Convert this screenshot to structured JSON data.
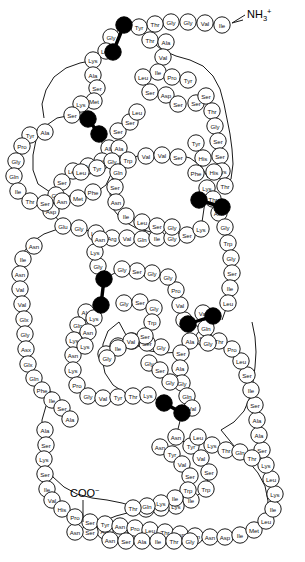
{
  "diagram": {
    "n_terminus_label": "NH",
    "n_terminus_sub": "3",
    "n_terminus_sup": "+",
    "c_terminus_label": "COO",
    "c_terminus_sup": "−",
    "residue_shape": "circle",
    "disulfide_shape": "filled-circle-pair",
    "colors": {
      "residue_fill": "#ffffff",
      "residue_stroke": "#1a1a1a",
      "cysteine_fill": "#000000",
      "background": "#ffffff",
      "text": "#111111"
    },
    "counts": {
      "disulfide_bonds": 6
    }
  },
  "residues": [
    {
      "n": 1,
      "label": "Ile",
      "x": 222,
      "y": 25
    },
    {
      "n": 2,
      "label": "Val",
      "x": 205,
      "y": 23
    },
    {
      "n": 3,
      "label": "Gly",
      "x": 188,
      "y": 22
    },
    {
      "n": 4,
      "label": "Gly",
      "x": 171,
      "y": 22
    },
    {
      "n": 5,
      "label": "Thr",
      "x": 155,
      "y": 24
    },
    {
      "n": 6,
      "label": "Tyr",
      "x": 139,
      "y": 27
    },
    {
      "n": 7,
      "label": "Cys",
      "x": 124,
      "y": 25,
      "cys": true
    },
    {
      "n": 8,
      "label": "Gly",
      "x": 111,
      "y": 37
    },
    {
      "n": 9,
      "label": "Cys",
      "x": 113,
      "y": 52,
      "cys": true
    },
    {
      "n": 10,
      "label": "Leu",
      "x": 106,
      "y": 51
    },
    {
      "n": 11,
      "label": "Lys",
      "x": 93,
      "y": 60
    },
    {
      "n": 12,
      "label": "Ala",
      "x": 93,
      "y": 75
    },
    {
      "n": 13,
      "label": "Ser",
      "x": 97,
      "y": 88
    },
    {
      "n": 14,
      "label": "Met",
      "x": 94,
      "y": 101
    },
    {
      "n": 15,
      "label": "Lys",
      "x": 81,
      "y": 104
    },
    {
      "n": 16,
      "label": "Ser",
      "x": 72,
      "y": 115
    },
    {
      "n": 17,
      "label": "Cys",
      "x": 88,
      "y": 119,
      "cys": true
    },
    {
      "n": 18,
      "label": "Cys",
      "x": 99,
      "y": 134,
      "cys": true
    },
    {
      "n": 19,
      "label": "Ala",
      "x": 109,
      "y": 148
    },
    {
      "n": 20,
      "label": "Gly",
      "x": 102,
      "y": 161
    },
    {
      "n": 21,
      "label": "Tyr",
      "x": 88,
      "y": 166
    },
    {
      "n": 22,
      "label": "Leu",
      "x": 73,
      "y": 171
    },
    {
      "n": 23,
      "label": "Ser",
      "x": 62,
      "y": 182
    },
    {
      "n": 24,
      "label": "Gly",
      "x": 56,
      "y": 195
    },
    {
      "n": 25,
      "label": "Asp",
      "x": 51,
      "y": 211
    },
    {
      "n": 26,
      "label": "Glu",
      "x": 63,
      "y": 226
    },
    {
      "n": 27,
      "label": "Gly",
      "x": 79,
      "y": 228
    },
    {
      "n": 28,
      "label": "Leu",
      "x": 96,
      "y": 233
    },
    {
      "n": 29,
      "label": "Arg",
      "x": 112,
      "y": 238
    },
    {
      "n": 30,
      "label": "Val",
      "x": 127,
      "y": 238
    },
    {
      "n": 31,
      "label": "Gln",
      "x": 142,
      "y": 239
    },
    {
      "n": 32,
      "label": "Ile",
      "x": 157,
      "y": 238
    },
    {
      "n": 33,
      "label": "Gly",
      "x": 172,
      "y": 238
    },
    {
      "n": 34,
      "label": "Ser",
      "x": 187,
      "y": 235
    },
    {
      "n": 35,
      "label": "Lys",
      "x": 201,
      "y": 229
    },
    {
      "n": 36,
      "label": "Lys",
      "x": 207,
      "y": 188
    },
    {
      "n": 37,
      "label": "Thr",
      "x": 213,
      "y": 199
    },
    {
      "n": 38,
      "label": "Asn",
      "x": 219,
      "y": 213
    },
    {
      "n": 39,
      "label": "Gly",
      "x": 225,
      "y": 227
    },
    {
      "n": 40,
      "label": "Trp",
      "x": 228,
      "y": 243
    },
    {
      "n": 41,
      "label": "Gly",
      "x": 231,
      "y": 258
    },
    {
      "n": 42,
      "label": "Ser",
      "x": 232,
      "y": 273
    },
    {
      "n": 43,
      "label": "Ile",
      "x": 230,
      "y": 288
    },
    {
      "n": 44,
      "label": "Leu",
      "x": 228,
      "y": 303
    },
    {
      "n": 45,
      "label": "Cys",
      "x": 222,
      "y": 320,
      "cys": true
    },
    {
      "n": 46,
      "label": "Cys",
      "x": 199,
      "y": 327,
      "cys": true
    },
    {
      "n": 47,
      "label": "Val",
      "x": 184,
      "y": 320
    },
    {
      "n": 48,
      "label": "Val",
      "x": 180,
      "y": 305
    },
    {
      "n": 49,
      "label": "Pro",
      "x": 176,
      "y": 290
    },
    {
      "n": 50,
      "label": "Gly",
      "x": 168,
      "y": 277
    },
    {
      "n": 51,
      "label": "Gly",
      "x": 152,
      "y": 273
    },
    {
      "n": 52,
      "label": "Ser",
      "x": 137,
      "y": 271
    },
    {
      "n": 53,
      "label": "Gly",
      "x": 122,
      "y": 269
    },
    {
      "n": 54,
      "label": "Cys",
      "x": 104,
      "y": 279,
      "cys": true
    },
    {
      "n": 55,
      "label": "Cys",
      "x": 101,
      "y": 305,
      "cys": true
    },
    {
      "n": 56,
      "label": "Ala",
      "x": 86,
      "y": 312
    },
    {
      "n": 57,
      "label": "Gln",
      "x": 78,
      "y": 325
    },
    {
      "n": 58,
      "label": "Lys",
      "x": 74,
      "y": 340
    },
    {
      "n": 59,
      "label": "Asn",
      "x": 73,
      "y": 355
    },
    {
      "n": 60,
      "label": "Lys",
      "x": 73,
      "y": 370
    },
    {
      "n": 61,
      "label": "Pro",
      "x": 77,
      "y": 385
    },
    {
      "n": 62,
      "label": "Gly",
      "x": 88,
      "y": 396
    },
    {
      "n": 63,
      "label": "Val",
      "x": 103,
      "y": 398
    },
    {
      "n": 64,
      "label": "Tyr",
      "x": 118,
      "y": 397
    },
    {
      "n": 65,
      "label": "Thr",
      "x": 133,
      "y": 396
    },
    {
      "n": 66,
      "label": "Lys",
      "x": 148,
      "y": 395
    },
    {
      "n": 67,
      "label": "Cys",
      "x": 164,
      "y": 403,
      "cys": true
    },
    {
      "n": 68,
      "label": "Cys",
      "x": 182,
      "y": 413,
      "cys": true
    },
    {
      "n": 69,
      "label": "Asn",
      "x": 176,
      "y": 437
    },
    {
      "n": 70,
      "label": "Tyr",
      "x": 191,
      "y": 446
    },
    {
      "n": 71,
      "label": "Val",
      "x": 201,
      "y": 458
    },
    {
      "n": 72,
      "label": "Ser",
      "x": 209,
      "y": 472
    },
    {
      "n": 73,
      "label": "Trp",
      "x": 206,
      "y": 489
    },
    {
      "n": 74,
      "label": "Ile",
      "x": 191,
      "y": 500
    },
    {
      "n": 75,
      "label": "Lys",
      "x": 176,
      "y": 506
    },
    {
      "n": 76,
      "label": "Gln",
      "x": 161,
      "y": 508
    },
    {
      "n": 77,
      "label": "Thr",
      "x": 146,
      "y": 509
    },
    {
      "n": 78,
      "label": "Ile",
      "x": 120,
      "y": 530
    },
    {
      "n": 79,
      "label": "Ala",
      "x": 105,
      "y": 531
    },
    {
      "n": 80,
      "label": "Ser",
      "x": 90,
      "y": 532
    },
    {
      "n": 81,
      "label": "Asn",
      "x": 75,
      "y": 532
    }
  ],
  "chain_paths": [
    "Ile Val Gly Gly Thr Tyr Cys Gly Cys Leu Lys Ala Ser Met Lys Ser",
    "Cys Cys Ala Gly Tyr Leu Ser Gly Asp Glu Gly Leu Arg Val Gln Ile Gly Ser Lys",
    "Lys Thr Asn Gly Trp Gly Ser Ile Leu Cys Cys Val Val Pro Gly Gly Ser Gly",
    "Cys Cys Ala Gln Lys Asn Lys Pro Gly Val Tyr Thr Lys Cys Cys",
    "Asn Tyr Val Ser Trp Ile Lys Gln Thr Ile Ala Ser Asn"
  ],
  "labels_visible": [
    "Ile",
    "Val",
    "Gly",
    "Thr",
    "Tyr",
    "Cys",
    "Leu",
    "Lys",
    "Ala",
    "Ser",
    "Met",
    "Asp",
    "Pro",
    "Glu",
    "Arg",
    "Gln",
    "Asn",
    "Trp",
    "Phe",
    "His",
    "Glx",
    "Asx"
  ]
}
